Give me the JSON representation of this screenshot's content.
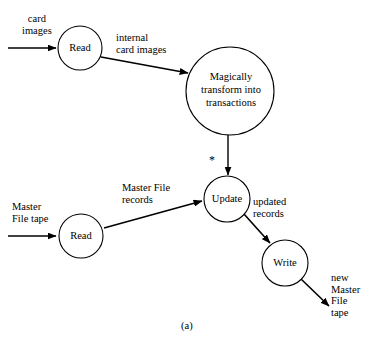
{
  "figure": {
    "caption": "(a)",
    "type": "dataflow-diagram"
  },
  "nodes": [
    {
      "id": "read-cards",
      "label": "Read",
      "cx": 80,
      "cy": 48,
      "r": 22
    },
    {
      "id": "transform",
      "label": "Magically transform into transactions",
      "line1": "Magically",
      "line2": "transform into",
      "line3": "transactions",
      "cx": 230,
      "cy": 91,
      "r": 44
    },
    {
      "id": "update",
      "label": "Update",
      "cx": 227,
      "cy": 199,
      "r": 23
    },
    {
      "id": "read-master",
      "label": "Read",
      "cx": 81,
      "cy": 236,
      "r": 22
    },
    {
      "id": "write",
      "label": "Write",
      "cx": 285,
      "cy": 263,
      "r": 23
    }
  ],
  "edges": [
    {
      "id": "card-images-in",
      "label": "card\nimages",
      "from": "input",
      "to": "read-cards"
    },
    {
      "id": "internal-cards",
      "label": "internal\ncard images",
      "from": "read-cards",
      "to": "transform"
    },
    {
      "id": "transactions",
      "label": "",
      "from": "transform",
      "to": "update"
    },
    {
      "id": "master-file-tape",
      "label": "Master\nFile tape",
      "from": "input",
      "to": "read-master"
    },
    {
      "id": "master-file-recs",
      "label": "Master File\nrecords",
      "from": "read-master",
      "to": "update"
    },
    {
      "id": "updated-records",
      "label": "updated\nrecords",
      "from": "update",
      "to": "write"
    },
    {
      "id": "new-master-tape",
      "label": "new\nMaster\nFile\ntape",
      "from": "write",
      "to": "output"
    }
  ],
  "annotations": {
    "asterisk": "*"
  },
  "colors": {
    "stroke": "#000000",
    "background": "#ffffff",
    "text": "#000000"
  }
}
